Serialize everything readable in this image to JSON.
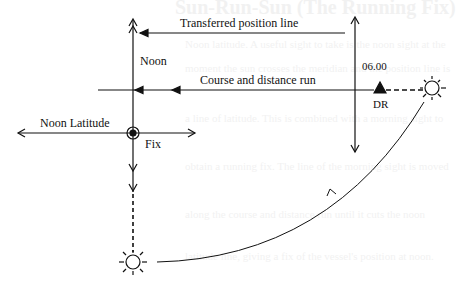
{
  "diagram": {
    "labels": {
      "transferred_position_line": "Transferred position line",
      "noon": "Noon",
      "time_0600": "06.00",
      "course_and_distance_run": "Course and distance run",
      "dr": "DR",
      "noon_latitude": "Noon Latitude",
      "fix": "Fix"
    },
    "colors": {
      "line": "#111111",
      "background": "#ffffff"
    },
    "elements": {
      "noon_meridian": {
        "x": 133,
        "y_top": 20,
        "y_bottom": 250
      },
      "morning_position_line": {
        "x": 355,
        "y_top": 20,
        "y_bottom": 152
      },
      "transferred_line": {
        "y": 33,
        "x_from": 345,
        "x_to": 140
      },
      "course_line": {
        "y": 90,
        "x_from": 378,
        "x_to": 98
      },
      "noon_latitude_line": {
        "y": 133,
        "x_from": 18,
        "x_to": 195
      },
      "fix": {
        "x": 133,
        "y": 133
      },
      "dr": {
        "x": 380,
        "y": 90
      },
      "sun_morning": {
        "x": 432,
        "y": 88
      },
      "sun_noon": {
        "x": 133,
        "y": 262
      }
    }
  },
  "background_text": {
    "heading": "Sun-Run-Sun (The Running Fix)",
    "lines": [
      "Noon latitude. A useful sight to take is the noon sight at the",
      "moment the sun crosses the meridian and the position line is",
      "a line of latitude. This is combined with a morning sight to",
      "obtain a running fix. The line of the morning sight is moved",
      "along the course and distance run until it cuts the noon",
      "latitude line, giving a fix of the vessel's position at noon."
    ]
  }
}
